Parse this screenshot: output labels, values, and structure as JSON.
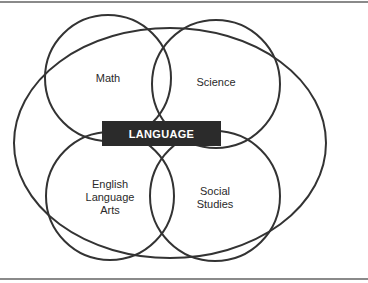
{
  "diagram": {
    "type": "venn",
    "center_label": "LANGUAGE",
    "sets": [
      {
        "id": "math",
        "label": "Math"
      },
      {
        "id": "science",
        "label": "Science"
      },
      {
        "id": "ela",
        "label": "English\nLanguage\nArts"
      },
      {
        "id": "social",
        "label": "Social\nStudies"
      }
    ],
    "enclosing_ellipse": {
      "represents": "LANGUAGE"
    },
    "colors": {
      "stroke": "#333333",
      "center_box_fill": "#2b2b2b",
      "center_box_text": "#ffffff",
      "frame": "#8a8a8a"
    }
  }
}
